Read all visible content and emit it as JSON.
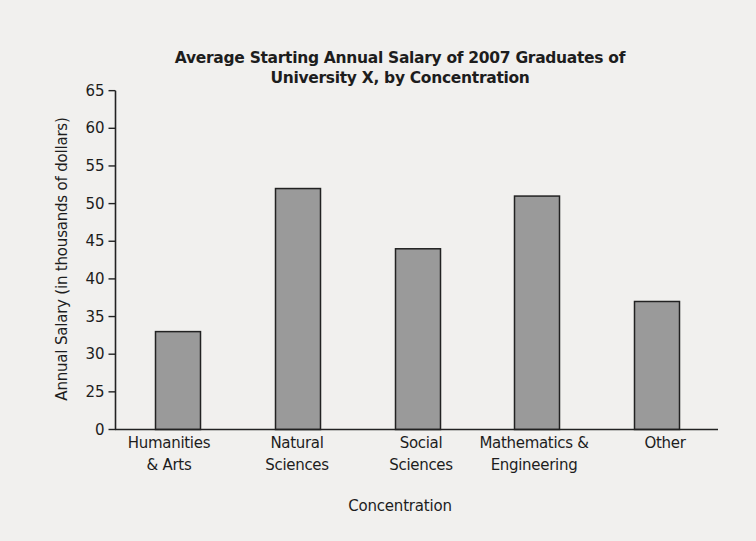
{
  "chart_data": {
    "type": "bar",
    "title": "Average Starting  Annual Salary of 2007 Graduates of University X, by Concentration",
    "title_lines": [
      "Average Starting  Annual Salary of 2007 Graduates of",
      "University X, by Concentration"
    ],
    "xlabel": "Concentration",
    "ylabel": "Annual Salary (in thousands of dollars)",
    "categories": [
      "Humanities & Arts",
      "Natural Sciences",
      "Social Sciences",
      "Mathematics & Engineering",
      "Other"
    ],
    "category_label_lines": [
      "Humanities\n& Arts",
      "Natural\nSciences",
      "Social\nSciences",
      "Mathematics &\nEngineering",
      "Other"
    ],
    "values": [
      33,
      52,
      44,
      51,
      37
    ],
    "y_ticks": [
      0,
      25,
      30,
      35,
      40,
      45,
      50,
      55,
      60,
      65
    ],
    "ylim": [
      0,
      65
    ],
    "axis_break": "y-axis jumps from 0 to 25",
    "grid": false,
    "legend": null,
    "bar_color": "#9a9a9a",
    "bar_edge_color": "#222222"
  }
}
